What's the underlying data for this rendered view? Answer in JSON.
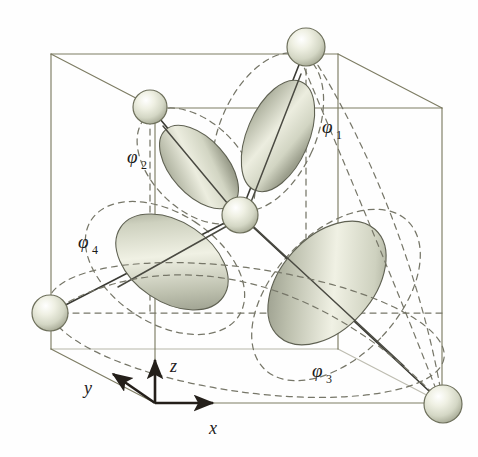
{
  "figure": {
    "background_color": "#fefefe",
    "cube_edge_color": "#7d7c63",
    "dashed_guide_color": "#6f6f6f",
    "bond_line_color": "#3a3a34",
    "axis_color": "#241f1a",
    "sphere_fill": "#d9dccb",
    "sphere_edge": "#6e705c",
    "lobe_light": "#f2f2e4",
    "lobe_mid": "#c9ccba",
    "lobe_dark": "#8d9080"
  },
  "orbital_labels": [
    {
      "name": "phi-1",
      "symbol": "φ",
      "subscript": "1",
      "x": 322,
      "y": 133
    },
    {
      "name": "phi-2",
      "symbol": "φ",
      "subscript": "2",
      "x": 127,
      "y": 163
    },
    {
      "name": "phi-3",
      "symbol": "φ",
      "subscript": "3",
      "x": 312,
      "y": 377
    },
    {
      "name": "phi-4",
      "symbol": "φ",
      "subscript": "4",
      "x": 78,
      "y": 248
    }
  ],
  "axes": [
    {
      "name": "x-axis",
      "label": "x",
      "label_x": 213,
      "label_y": 433,
      "tip_x": 215,
      "tip_y": 403
    },
    {
      "name": "y-axis",
      "label": "y",
      "label_x": 85,
      "label_y": 392,
      "tip_x": 110,
      "tip_y": 371
    },
    {
      "name": "z-axis",
      "label": "z",
      "label_x": 171,
      "label_y": 372,
      "tip_x": 155,
      "tip_y": 358
    }
  ],
  "axis_origin": {
    "x": 155,
    "y": 403
  },
  "atoms": [
    {
      "name": "central-atom",
      "x": 240,
      "y": 215,
      "r": 18
    },
    {
      "name": "ligand-atom-phi1",
      "x": 306,
      "y": 47,
      "r": 19
    },
    {
      "name": "ligand-atom-phi2",
      "x": 150,
      "y": 107,
      "r": 17
    },
    {
      "name": "ligand-atom-phi4",
      "x": 50,
      "y": 313,
      "r": 18
    },
    {
      "name": "ligand-atom-phi3",
      "x": 443,
      "y": 404,
      "r": 19
    }
  ],
  "lobes": [
    {
      "name": "lobe-phi1",
      "cx": 278,
      "cy": 136,
      "rx": 31,
      "ry": 59,
      "rotate": 23
    },
    {
      "name": "lobe-phi2",
      "cx": 199,
      "cy": 167,
      "rx": 28,
      "ry": 50,
      "rotate": -42
    },
    {
      "name": "lobe-phi3",
      "cx": 327,
      "cy": 283,
      "rx": 46,
      "ry": 72,
      "rotate": 42
    },
    {
      "name": "lobe-phi4",
      "cx": 172,
      "cy": 262,
      "rx": 40,
      "ry": 62,
      "rotate": -56
    }
  ],
  "cube": {
    "front_face": {
      "left": 155,
      "top": 108,
      "right": 442,
      "bottom": 403
    },
    "back_offset": {
      "dx": -104,
      "dy": -54
    }
  }
}
